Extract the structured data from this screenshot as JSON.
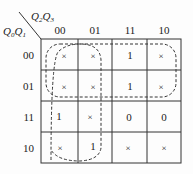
{
  "diagram": {
    "type": "karnaugh-map",
    "corner": {
      "col_vars": {
        "v1": "Q",
        "s1": "2",
        "v2": "Q",
        "s2": "3"
      },
      "row_vars": {
        "v1": "Q",
        "s1": "0",
        "v2": "Q",
        "s2": "1"
      }
    },
    "col_headers": [
      "00",
      "01",
      "11",
      "10"
    ],
    "row_headers": [
      "00",
      "01",
      "11",
      "10"
    ],
    "cells": [
      [
        "×",
        "×",
        "1",
        "×"
      ],
      [
        "×",
        "×",
        "1",
        "×"
      ],
      [
        "1",
        "×",
        "0",
        "0"
      ],
      [
        "×",
        "1",
        "×",
        "×"
      ]
    ],
    "groupings": [
      {
        "name": "rows-00-01-all-columns",
        "rows": [
          "00",
          "01"
        ],
        "cols": [
          "00",
          "01",
          "11",
          "10"
        ]
      },
      {
        "name": "cols-00-01-all-rows",
        "rows": [
          "00",
          "01",
          "11",
          "10"
        ],
        "cols": [
          "00",
          "01"
        ]
      }
    ]
  }
}
